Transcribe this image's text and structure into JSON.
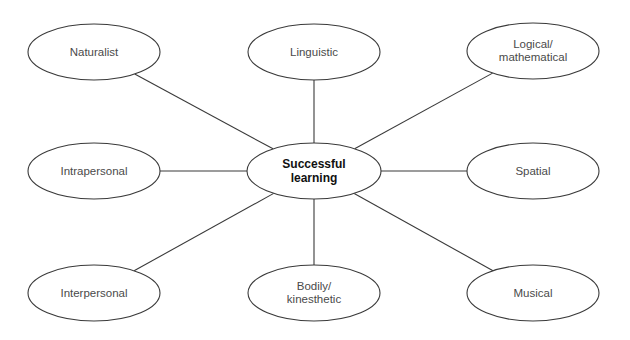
{
  "diagram": {
    "type": "hub-and-spoke",
    "center": {
      "label": "Successful\nlearning",
      "cx": 314,
      "cy": 171,
      "rx": 67,
      "ry": 28
    },
    "nodes": [
      {
        "id": "naturalist",
        "label": "Naturalist",
        "cx": 94,
        "cy": 52,
        "rx": 66,
        "ry": 28
      },
      {
        "id": "linguistic",
        "label": "Linguistic",
        "cx": 314,
        "cy": 52,
        "rx": 66,
        "ry": 28
      },
      {
        "id": "logical",
        "label": "Logical/\nmathematical",
        "cx": 533,
        "cy": 51,
        "rx": 66,
        "ry": 28
      },
      {
        "id": "intrapersonal",
        "label": "Intrapersonal",
        "cx": 94,
        "cy": 171,
        "rx": 66,
        "ry": 28
      },
      {
        "id": "spatial",
        "label": "Spatial",
        "cx": 533,
        "cy": 171,
        "rx": 66,
        "ry": 28
      },
      {
        "id": "interpersonal",
        "label": "Interpersonal",
        "cx": 94,
        "cy": 293,
        "rx": 66,
        "ry": 28
      },
      {
        "id": "bodily",
        "label": "Bodily/\nkinesthetic",
        "cx": 314,
        "cy": 293,
        "rx": 66,
        "ry": 28
      },
      {
        "id": "musical",
        "label": "Musical",
        "cx": 533,
        "cy": 293,
        "rx": 66,
        "ry": 28
      }
    ],
    "colors": {
      "stroke": "#3a3a3a",
      "fill": "#ffffff",
      "text": "#4a4a4a",
      "center_text": "#111111"
    }
  }
}
